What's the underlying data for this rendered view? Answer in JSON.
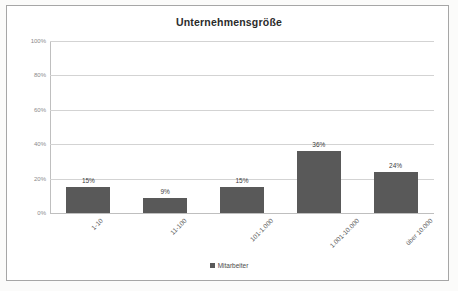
{
  "chart_data": {
    "type": "bar",
    "title": "Unternehmensgröße",
    "xlabel": "",
    "ylabel": "",
    "categories": [
      "1-10",
      "11-100",
      "101-1.000",
      "1.001-10.000",
      "über 10.000"
    ],
    "values": [
      15,
      9,
      15,
      36,
      24
    ],
    "value_labels": [
      "15%",
      "9%",
      "15%",
      "36%",
      "24%"
    ],
    "series": [
      {
        "name": "Mitarbeiter",
        "values": [
          15,
          9,
          15,
          36,
          24
        ]
      }
    ],
    "ylim": [
      0,
      100
    ],
    "yticks": [
      0,
      20,
      40,
      60,
      80,
      100
    ],
    "ytick_labels": [
      "0%",
      "20%",
      "40%",
      "60%",
      "80%",
      "100%"
    ],
    "grid": true,
    "legend_position": "bottom",
    "bar_color": "#595959",
    "gridline_color": "#d3d3d3"
  },
  "legend": {
    "entries": [
      {
        "label": "Mitarbeiter",
        "color": "#595959"
      }
    ]
  },
  "frame": {
    "border_color": "#a6a6a6",
    "background": "#ffffff"
  }
}
